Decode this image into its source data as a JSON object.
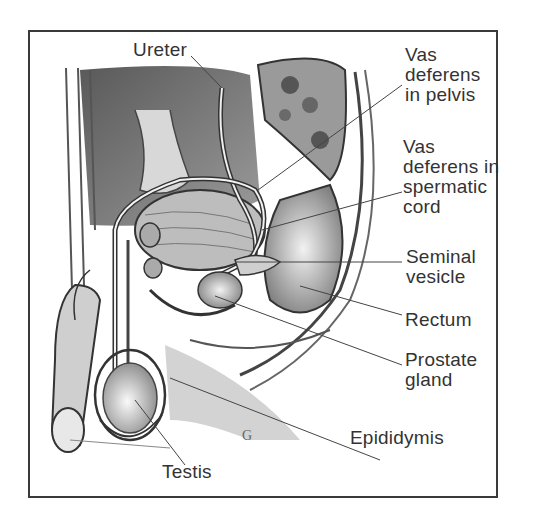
{
  "diagram": {
    "labels": {
      "ureter": "Ureter",
      "vas_pelvis": "Vas\ndeferens\nin pelvis",
      "vas_cord": "Vas\ndeferens in\nspermatic\ncord",
      "seminal_vesicle": "Seminal\nvesicle",
      "rectum": "Rectum",
      "prostate": "Prostate\ngland",
      "epididymis": "Epididymis",
      "testis": "Testis"
    },
    "colors": {
      "border": "#3a3a3a",
      "text": "#333333",
      "leader": "#444444"
    }
  }
}
